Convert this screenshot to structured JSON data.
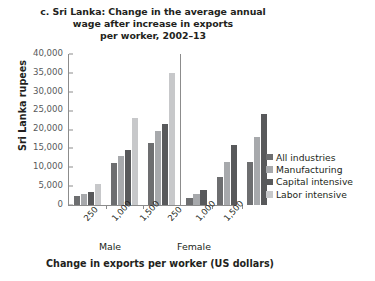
{
  "chart_data": {
    "type": "bar",
    "title": "c. Sri Lanka: Change in the average annual wage after increase in exports per worker, 2002–13",
    "title_lines": [
      "c. Sri Lanka: Change in the average annual",
      "wage after increase in exports",
      "per worker, 2002–13"
    ],
    "xlabel": "Change in exports per worker (US dollars)",
    "ylabel": "Sri Lanka rupees",
    "ylim": [
      0,
      40000
    ],
    "ytick_values": [
      0,
      5000,
      10000,
      15000,
      20000,
      25000,
      30000,
      35000,
      40000
    ],
    "ytick_labels": [
      "0",
      "5,000",
      "10,000",
      "15,000",
      "20,000",
      "25,000",
      "30,000",
      "35,000",
      "40,000"
    ],
    "grid": false,
    "legend_position": "right",
    "group_labels": [
      "Male",
      "Female"
    ],
    "categories": [
      "250",
      "1,000",
      "1,500"
    ],
    "series_names": [
      "All industries",
      "Manufacturing",
      "Capital intensive",
      "Labor intensive"
    ],
    "series_colors": [
      "#6d6e70",
      "#a7a9ac",
      "#58595b",
      "#c7c8ca"
    ],
    "groups": [
      {
        "label": "Male",
        "bars": [
          {
            "category": "250",
            "values": [
              2500,
              2800,
              3500,
              5500
            ]
          },
          {
            "category": "1,000",
            "values": [
              11000,
              13000,
              14500,
              23000
            ]
          },
          {
            "category": "1,500",
            "values": [
              16500,
              19500,
              21500,
              35000
            ]
          }
        ]
      },
      {
        "label": "Female",
        "bars": [
          {
            "category": "250",
            "values": [
              1800,
              2800,
              4000,
              null
            ]
          },
          {
            "category": "1,000",
            "values": [
              7500,
              11500,
              16000,
              null
            ]
          },
          {
            "category": "1,500",
            "values": [
              11500,
              18000,
              24000,
              null
            ]
          }
        ]
      }
    ],
    "legend": [
      {
        "label": "All industries",
        "color": "#6d6e70"
      },
      {
        "label": "Manufacturing",
        "color": "#a7a9ac"
      },
      {
        "label": "Capital intensive",
        "color": "#58595b"
      },
      {
        "label": "Labor intensive",
        "color": "#c7c8ca"
      }
    ]
  }
}
